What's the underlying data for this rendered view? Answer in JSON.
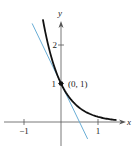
{
  "chart_data": {
    "type": "line",
    "title": "",
    "xlabel": "x",
    "ylabel": "y",
    "xlim": [
      -1.5,
      1.55
    ],
    "ylim": [
      -0.55,
      2.7
    ],
    "grid": false,
    "x_ticks": [
      {
        "value": -1,
        "label": "−1"
      },
      {
        "value": 1,
        "label": "1"
      }
    ],
    "y_ticks": [
      {
        "value": 1,
        "label": "1"
      },
      {
        "value": 2,
        "label": "2"
      }
    ],
    "series": [
      {
        "name": "curve",
        "function": "y = e^(-2x)",
        "color": "#111111",
        "x_range": [
          -0.49,
          1.5
        ]
      },
      {
        "name": "tangent-line",
        "function": "y = 1 - 2x",
        "color": "#6aaed6",
        "x_range": [
          -0.78,
          0.72
        ]
      }
    ],
    "points": [
      {
        "x": 0,
        "y": 1,
        "label": "(0, 1)"
      }
    ]
  }
}
